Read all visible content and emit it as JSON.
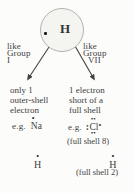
{
  "colors": {
    "background": "#fcfcfb",
    "ink": "#414141",
    "circle_fill": "#f4f4f1",
    "circle_border": "#b3b3ae",
    "arrow": "#414141"
  },
  "title_atom": {
    "symbol": "H",
    "electron_dot": "•"
  },
  "left_branch": {
    "label_lines": [
      "like",
      "Group",
      "I"
    ],
    "description_lines": [
      "only 1",
      "outer-shell",
      "electron"
    ],
    "example": {
      "prefix": "e.g.",
      "symbol": "Na",
      "dot_above": "•"
    },
    "hydrogen_example": {
      "symbol": "H",
      "dot_above": "•"
    }
  },
  "right_branch": {
    "label_lines": [
      "like",
      "Group",
      "VII"
    ],
    "description_lines": [
      "1 electron",
      "short of a",
      "full shell"
    ],
    "example": {
      "prefix": "e.g.",
      "symbol": "Cl",
      "dots_above": "••",
      "dots_left": ":",
      "dot_right": "•",
      "dots_below": "••",
      "note": "(full shell 8)"
    },
    "hydrogen_example": {
      "symbol": "H",
      "dot_above": "•",
      "note": "(full shell 2)"
    }
  }
}
